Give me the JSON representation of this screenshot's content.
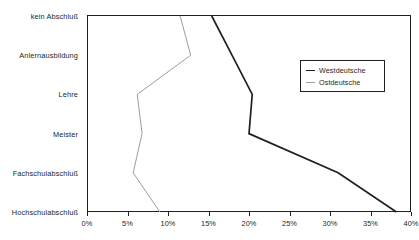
{
  "chart_data": {
    "type": "line",
    "title": "",
    "subtitle": "",
    "xlabel": "",
    "ylabel": "",
    "orientation": "horizontal",
    "grid": false,
    "legend_position": "right-inside",
    "categories": [
      "kein Abschluß",
      "Anlernausbildung",
      "Lehre",
      "Meister",
      "Fachschulabschluß",
      "Hochschulabschluß"
    ],
    "xlim": [
      0,
      40
    ],
    "x_ticks": [
      0,
      5,
      10,
      15,
      20,
      25,
      30,
      35,
      40
    ],
    "x_tick_labels": [
      "0%",
      "5%",
      "10%",
      "15%",
      "20%",
      "25%",
      "30%",
      "35%",
      "40%"
    ],
    "series": [
      {
        "name": "Westdeutsche",
        "color": "#231f20",
        "values": [
          15.4,
          17.9,
          20.4,
          20.0,
          31.0,
          38.2
        ]
      },
      {
        "name": "Ostdeutsche",
        "color": "#9d9d9d",
        "values": [
          11.5,
          12.8,
          6.2,
          6.8,
          5.7,
          9.0
        ]
      }
    ]
  },
  "legend": {
    "entries": [
      {
        "label": "Westdeutsche"
      },
      {
        "label": "Ostdeutsche"
      }
    ]
  },
  "colors": {
    "axis": "#231f20",
    "west": "#231f20",
    "east": "#9d9d9d",
    "background": "#ffffff"
  }
}
